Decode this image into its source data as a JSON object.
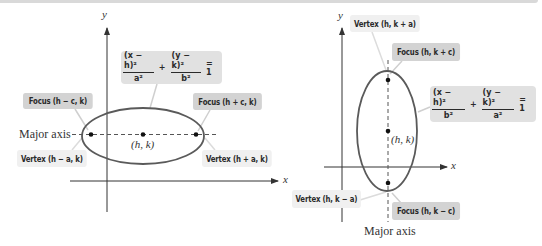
{
  "left_panel": {
    "axes": {
      "x_label": "x",
      "y_label": "y"
    },
    "equation": {
      "term1_num": "(x − h)²",
      "term1_den": "a²",
      "plus": "+",
      "term2_num": "(y − k)²",
      "term2_den": "b²",
      "equals": "= 1"
    },
    "labels": {
      "focus_left": "Focus (h − c, k)",
      "focus_right": "Focus (h + c, k)",
      "vertex_left": "Vertex (h − a, k)",
      "vertex_right": "Vertex (h + a, k)",
      "center": "(h, k)",
      "major_axis": "Major axis"
    },
    "orientation": "horizontal major axis"
  },
  "right_panel": {
    "axes": {
      "x_label": "x",
      "y_label": "y"
    },
    "equation": {
      "term1_num": "(x − h)²",
      "term1_den": "b²",
      "plus": "+",
      "term2_num": "(y − k)²",
      "term2_den": "a²",
      "equals": "= 1"
    },
    "labels": {
      "vertex_top": "Vertex (h, k + a)",
      "focus_top": "Focus (h, k + c)",
      "vertex_bottom": "Vertex (h, k − a)",
      "focus_bottom": "Focus (h, k − c)",
      "center": "(h, k)",
      "major_axis": "Major axis"
    },
    "orientation": "vertical major axis"
  },
  "colors": {
    "focus_label_bg": "#d3d3d3",
    "vertex_label_bg": "#f0f0f0",
    "equation_bg": "#e1e1e1",
    "ellipse_stroke": "#5a5a5a",
    "axis_stroke": "#333333"
  }
}
